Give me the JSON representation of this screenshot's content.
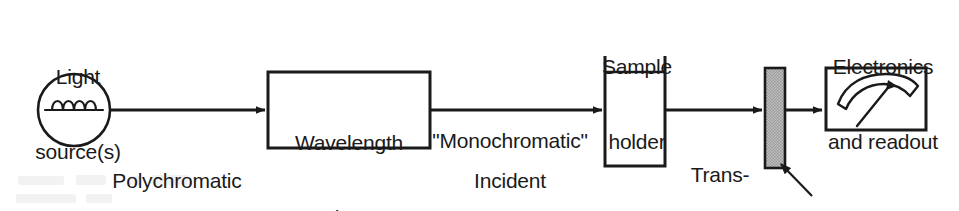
{
  "diagram": {
    "background_color": "#ffffff",
    "line_color": "#1a1a1a",
    "text_color": "#1a1a1a",
    "detector_fill_color": "#b0b0b0"
  },
  "labels": {
    "light_source": {
      "line1": "Light",
      "line2": "source(s)"
    },
    "polychromatic": {
      "line1": "Polychromatic",
      "line2": "light"
    },
    "wavelength_selector": {
      "line1": "Wavelength",
      "line2": "selector"
    },
    "monochromatic": {
      "line1": "\"Monochromatic\""
    },
    "incident": {
      "line1": "Incident",
      "line2": "light"
    },
    "sample_holder": {
      "line1": "Sample",
      "line2": "holder"
    },
    "transmitted": {
      "line1": "Trans-",
      "line2": "mitted",
      "line3": "light"
    },
    "electronics": {
      "line1": "Electronics",
      "line2": "and readout"
    },
    "detector": {
      "line1": "Detector"
    }
  },
  "components": [
    {
      "name": "light-source-lamp",
      "type": "circle-with-filament",
      "label": "Light source(s)"
    },
    {
      "name": "wavelength-selector-box",
      "type": "rectangle",
      "label": "Wavelength selector"
    },
    {
      "name": "sample-holder-cuvette",
      "type": "open-top-cell",
      "label": "Sample holder"
    },
    {
      "name": "detector-bar",
      "type": "shaded-bar",
      "label": "Detector"
    },
    {
      "name": "readout-meter",
      "type": "analog-meter",
      "label": "Electronics and readout"
    }
  ],
  "beam_path": [
    {
      "from": "light-source-lamp",
      "to": "wavelength-selector-box",
      "label": "Polychromatic light"
    },
    {
      "from": "wavelength-selector-box",
      "to": "sample-holder-cuvette",
      "label": "\"Monochromatic\" Incident light"
    },
    {
      "from": "sample-holder-cuvette",
      "to": "detector-bar",
      "label": "Transmitted light"
    },
    {
      "from": "detector-bar",
      "to": "readout-meter",
      "label": ""
    }
  ]
}
